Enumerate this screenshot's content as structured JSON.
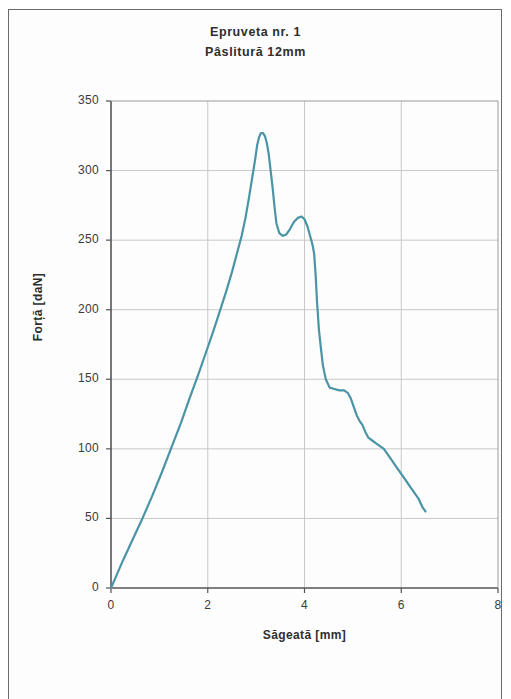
{
  "figure": {
    "background_color": "#ffffff",
    "frame_color": "#6a6a6a"
  },
  "chart_data": {
    "type": "line",
    "title": "Epruveta nr. 1",
    "subtitle": "Pâslitură 12mm",
    "xlabel": "Săgeată [mm]",
    "ylabel": "Forță [daN]",
    "xlim": [
      0,
      8
    ],
    "ylim": [
      0,
      350
    ],
    "xticks": [
      0,
      2,
      4,
      6,
      8
    ],
    "yticks": [
      0,
      50,
      100,
      150,
      200,
      250,
      300,
      350
    ],
    "grid": true,
    "grid_color": "#c8c8c8",
    "legend": null,
    "series": [
      {
        "name": "Forță-Săgeată",
        "color": "#4a94a6",
        "line_width": 2.2,
        "x": [
          0.0,
          0.1,
          0.25,
          0.45,
          0.65,
          0.85,
          1.05,
          1.25,
          1.45,
          1.62,
          1.8,
          1.95,
          2.1,
          2.25,
          2.38,
          2.5,
          2.6,
          2.7,
          2.78,
          2.85,
          2.92,
          2.98,
          3.02,
          3.06,
          3.1,
          3.14,
          3.18,
          3.22,
          3.26,
          3.3,
          3.34,
          3.38,
          3.42,
          3.48,
          3.55,
          3.62,
          3.7,
          3.78,
          3.86,
          3.94,
          4.0,
          4.06,
          4.1,
          4.14,
          4.17,
          4.2,
          4.23,
          4.26,
          4.3,
          4.34,
          4.38,
          4.44,
          4.52,
          4.62,
          4.72,
          4.82,
          4.9,
          4.96,
          5.02,
          5.08,
          5.14,
          5.2,
          5.26,
          5.32,
          5.4,
          5.48,
          5.56,
          5.64,
          5.72,
          5.8,
          5.88,
          5.96,
          6.04,
          6.12,
          6.2,
          6.28,
          6.36,
          6.44,
          6.5
        ],
        "y": [
          0,
          8,
          20,
          35,
          50,
          66,
          83,
          101,
          119,
          136,
          153,
          168,
          183,
          199,
          213,
          227,
          240,
          253,
          266,
          280,
          295,
          308,
          318,
          324,
          327,
          327,
          325,
          320,
          312,
          300,
          288,
          274,
          262,
          255,
          253,
          254,
          258,
          263,
          266,
          267,
          265,
          260,
          255,
          250,
          246,
          240,
          225,
          205,
          185,
          172,
          160,
          150,
          144,
          143,
          142,
          142,
          140,
          136,
          130,
          124,
          120,
          117,
          112,
          108,
          106,
          104,
          102,
          100,
          96,
          92,
          88,
          84,
          80,
          76,
          72,
          68,
          64,
          58,
          55
        ]
      }
    ]
  }
}
